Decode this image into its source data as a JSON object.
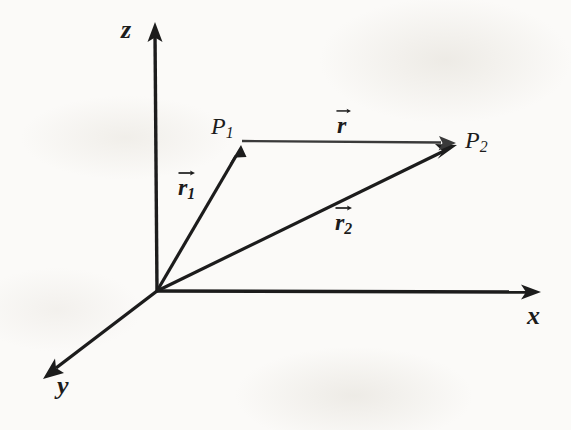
{
  "figure": {
    "background_color": "#fbfaf8",
    "ink_color": "#1c1c1c",
    "width": 571,
    "height": 430
  },
  "axes": [
    {
      "id": "z",
      "label": "z",
      "label_x": 130,
      "label_y": 30,
      "from": [
        157,
        291
      ],
      "to": [
        155,
        25
      ]
    },
    {
      "id": "x",
      "label": "x",
      "label_x": 535,
      "label_y": 316,
      "from": [
        157,
        291
      ],
      "to": [
        538,
        292
      ]
    },
    {
      "id": "y",
      "label": "y",
      "label_x": 65,
      "label_y": 386,
      "from": [
        157,
        291
      ],
      "to": [
        45,
        377
      ]
    }
  ],
  "points": [
    {
      "id": "P1",
      "label_base": "P",
      "label_sub": "1",
      "x": 241,
      "y": 147,
      "label_x": 222,
      "label_y": 127
    },
    {
      "id": "P2",
      "label_base": "P",
      "label_sub": "2",
      "x": 456,
      "y": 144,
      "label_x": 478,
      "label_y": 141
    }
  ],
  "vectors": [
    {
      "id": "r1",
      "label_base": "r",
      "label_sub": "1",
      "from": [
        157,
        291
      ],
      "to": [
        241,
        147
      ],
      "label_x": 192,
      "label_y": 186,
      "stroke": 3.1,
      "color": "#1c1c1c",
      "arrow_size": 13
    },
    {
      "id": "r2",
      "label_base": "r",
      "label_sub": "2",
      "from": [
        157,
        291
      ],
      "to": [
        456,
        145
      ],
      "label_x": 349,
      "label_y": 221,
      "stroke": 3.1,
      "color": "#1c1c1c",
      "arrow_size": 13
    },
    {
      "id": "r",
      "label_base": "r",
      "label_sub": "",
      "from": [
        241,
        141
      ],
      "to": [
        456,
        143
      ],
      "label_x": 344,
      "label_y": 123,
      "stroke": 2.3,
      "color": "#3a3a3a",
      "arrow_size": 12
    }
  ],
  "icons": {
    "vector_overarrow": "right-arrow-icon",
    "axis_arrowhead": "arrowhead-icon"
  }
}
